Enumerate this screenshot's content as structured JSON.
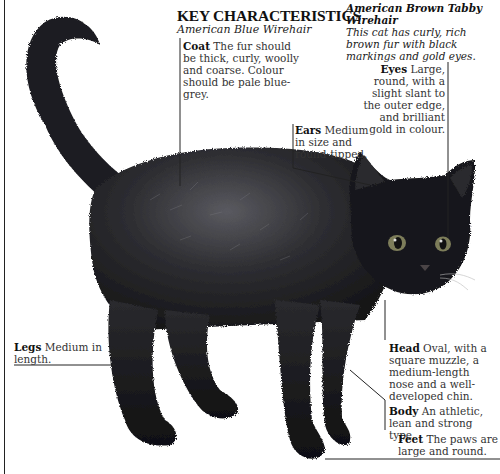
{
  "heading": {
    "title": "KEY CHARACTERISTICS",
    "breed": "American Blue Wirehair"
  },
  "variety": {
    "name": "American Brown Tabby Wirehair",
    "description": "This cat has curly, rich brown fur with black markings and gold eyes."
  },
  "labels": {
    "coat": {
      "term": "Coat",
      "text": "The fur should be thick, curly, woolly and coarse. Colour should be pale blue-grey."
    },
    "eyes": {
      "term": "Eyes",
      "text": "Large, round, with a slight slant to the outer edge, and brilliant gold in colour."
    },
    "ears": {
      "term": "Ears",
      "text": "Medium in size and round-tipped."
    },
    "legs": {
      "term": "Legs",
      "text": "Medium in length."
    },
    "head": {
      "term": "Head",
      "text": "Oval, with a square muzzle, a medium-length nose and a well-developed chin."
    },
    "body": {
      "term": "Body",
      "text": "An athletic, lean and strong type."
    },
    "feet": {
      "term": "Feet",
      "text": "The paws are large and round."
    }
  },
  "colors": {
    "cat_fur": "#1c1c1e",
    "fur_highlight": "#6a6a70",
    "eye": "#8a8a60",
    "line": "#222222"
  },
  "illustration": {
    "subject": "black-wirehair-cat-standing"
  }
}
